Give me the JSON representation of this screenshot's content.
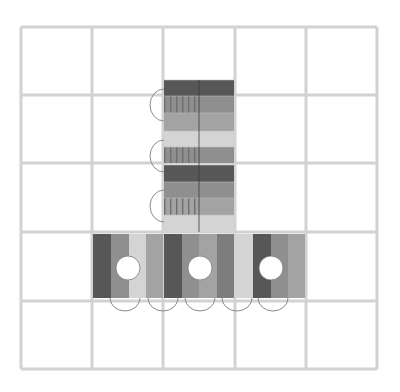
{
  "diagram": {
    "title": "",
    "canvas": {
      "width": 400,
      "height": 392,
      "background": "#ffffff"
    },
    "grid": {
      "rows": 5,
      "cols": 5,
      "x_lines": [
        21,
        92,
        163,
        235,
        306,
        377
      ],
      "y_lines": [
        27,
        95,
        163,
        232,
        301,
        369
      ],
      "line_color": "#d2d2d2",
      "line_width": 3
    },
    "colors": {
      "dark": "#575757",
      "medium_dark": "#7d7d7d",
      "medium": "#8f8f8f",
      "medium_light": "#a3a3a3",
      "light": "#d4d4d4",
      "stripe": "#6e6e6e",
      "divider": "#3a3a3a",
      "arc": "#8a8a8a",
      "hole": "#ffffff",
      "hole_border": "#777777"
    },
    "vertical_column": {
      "x": 164,
      "width": 70,
      "split_x": 199,
      "segments": [
        {
          "y": 80,
          "h": 16,
          "left": "dark",
          "right": "dark",
          "striped": false
        },
        {
          "y": 96,
          "h": 17,
          "left": "medium",
          "right": "medium",
          "striped": true
        },
        {
          "y": 113,
          "h": 18,
          "left": "medium_light",
          "right": "medium_light",
          "striped": false
        },
        {
          "y": 131,
          "h": 16,
          "left": "light",
          "right": "light",
          "striped": false
        },
        {
          "y": 147,
          "h": 16,
          "left": "medium",
          "right": "medium",
          "striped": true
        },
        {
          "y": 165,
          "h": 17,
          "left": "dark",
          "right": "dark",
          "striped": false
        },
        {
          "y": 182,
          "h": 16,
          "left": "medium",
          "right": "medium",
          "striped": false
        },
        {
          "y": 198,
          "h": 17,
          "left": "medium_light",
          "right": "medium_light",
          "striped": true
        },
        {
          "y": 215,
          "h": 17,
          "left": "light",
          "right": "light",
          "striped": false
        }
      ],
      "left_arcs": [
        {
          "cy": 105,
          "ry": 16,
          "rx": 14
        },
        {
          "cy": 156,
          "ry": 16,
          "rx": 14
        },
        {
          "cy": 206,
          "ry": 16,
          "rx": 14
        }
      ]
    },
    "horizontal_strip": {
      "y": 234,
      "height": 64,
      "bands": [
        {
          "x": 93,
          "w": 18,
          "shade": "dark"
        },
        {
          "x": 111,
          "w": 18,
          "shade": "medium"
        },
        {
          "x": 129,
          "w": 17,
          "shade": "light"
        },
        {
          "x": 146,
          "w": 17,
          "shade": "medium_light"
        },
        {
          "x": 164,
          "w": 18,
          "shade": "dark"
        },
        {
          "x": 182,
          "w": 17,
          "shade": "medium"
        },
        {
          "x": 199,
          "w": 18,
          "shade": "medium_light"
        },
        {
          "x": 217,
          "w": 17,
          "shade": "medium_dark"
        },
        {
          "x": 236,
          "w": 17,
          "shade": "light"
        },
        {
          "x": 253,
          "w": 18,
          "shade": "dark"
        },
        {
          "x": 271,
          "w": 17,
          "shade": "medium"
        },
        {
          "x": 288,
          "w": 17,
          "shade": "medium_light"
        }
      ],
      "holes": [
        {
          "cx": 128,
          "cy": 268,
          "r": 12
        },
        {
          "cx": 200,
          "cy": 268,
          "r": 12
        },
        {
          "cx": 271,
          "cy": 268,
          "r": 12
        }
      ],
      "bottom_arcs": [
        {
          "cx": 125,
          "rx": 15,
          "ry": 13
        },
        {
          "cx": 163,
          "rx": 15,
          "ry": 13
        },
        {
          "cx": 200,
          "rx": 15,
          "ry": 13
        },
        {
          "cx": 237,
          "rx": 15,
          "ry": 13
        },
        {
          "cx": 273,
          "rx": 15,
          "ry": 13
        }
      ],
      "arc_top_y": 298
    }
  }
}
